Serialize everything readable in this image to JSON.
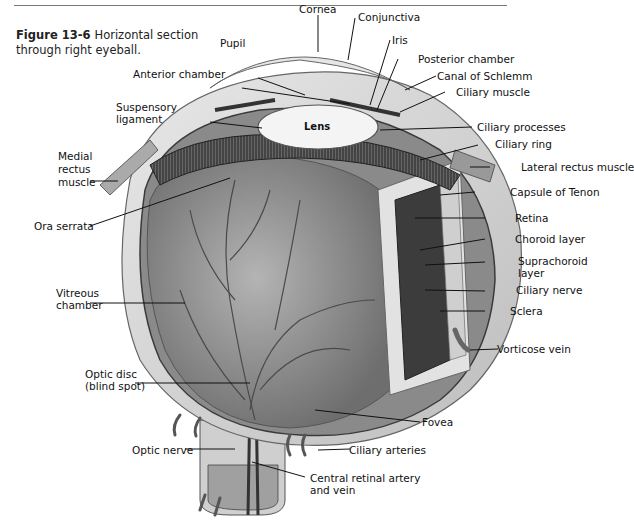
{
  "figure": {
    "number": "Figure 13-6",
    "caption": "Horizontal section through right eyeball."
  },
  "labels": {
    "cornea": "Cornea",
    "pupil": "Pupil",
    "conjunctiva": "Conjunctiva",
    "iris": "Iris",
    "anterior_chamber": "Anterior chamber",
    "posterior_chamber": "Posterior chamber",
    "canal_of_schlemm": "Canal of Schlemm",
    "suspensory_ligament_1": "Suspensory",
    "suspensory_ligament_2": "ligament",
    "lens": "Lens",
    "ciliary_muscle": "Ciliary muscle",
    "ciliary_processes": "Ciliary processes",
    "ciliary_ring": "Ciliary ring",
    "medial_rectus_1": "Medial",
    "medial_rectus_2": "rectus",
    "medial_rectus_3": "muscle",
    "lateral_rectus": "Lateral rectus muscle",
    "capsule_of_tenon": "Capsule of Tenon",
    "ora_serrata": "Ora serrata",
    "retina": "Retina",
    "choroid_layer": "Choroid layer",
    "suprachoroid_1": "Suprachoroid",
    "suprachoroid_2": "layer",
    "vitreous_1": "Vitreous",
    "vitreous_2": "chamber",
    "ciliary_nerve": "Ciliary nerve",
    "sclera": "Sclera",
    "vorticose_vein": "Vorticose vein",
    "optic_disc_1": "Optic disc",
    "optic_disc_2": "(blind spot)",
    "fovea": "Fovea",
    "optic_nerve": "Optic nerve",
    "ciliary_arteries": "Ciliary arteries",
    "central_retinal_1": "Central retinal artery",
    "central_retinal_2": "and vein"
  },
  "colors": {
    "ink": "#111111",
    "rule": "#777777",
    "sclera": "#d9d9d9",
    "vitreous": "#9a9a9a",
    "choroid": "#444444",
    "lens": "#f4f4f4"
  }
}
